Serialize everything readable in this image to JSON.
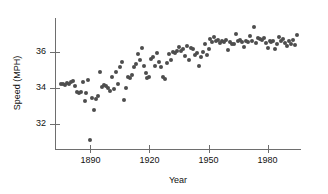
{
  "chart_data": {
    "type": "scatter",
    "title": "",
    "xlabel": "Year",
    "ylabel": "Speed (MPH)",
    "xlim": [
      1872,
      1997
    ],
    "ylim": [
      30.6,
      37.9
    ],
    "xticks": [
      1890,
      1920,
      1950,
      1980
    ],
    "xticklabels": [
      "1890",
      "1920",
      "1950",
      "1980"
    ],
    "yticks": [
      32,
      34,
      36
    ],
    "yticklabels": [
      "32",
      "34",
      "36"
    ],
    "grid": false,
    "legend": null,
    "marker_color": "#4d4d4d",
    "axis_color": "#6e6e6e",
    "points": [
      [
        1875,
        34.2
      ],
      [
        1876,
        34.25
      ],
      [
        1877,
        34.15
      ],
      [
        1878,
        34.3
      ],
      [
        1879,
        34.2
      ],
      [
        1880,
        34.35
      ],
      [
        1881,
        34.4
      ],
      [
        1882,
        34.1
      ],
      [
        1883,
        33.75
      ],
      [
        1884,
        33.7
      ],
      [
        1885,
        33.8
      ],
      [
        1886,
        34.35
      ],
      [
        1887,
        33.25
      ],
      [
        1888,
        33.7
      ],
      [
        1889,
        34.45
      ],
      [
        1890,
        31.1
      ],
      [
        1891,
        33.45
      ],
      [
        1892,
        32.75
      ],
      [
        1893,
        33.4
      ],
      [
        1894,
        33.55
      ],
      [
        1895,
        34.9
      ],
      [
        1896,
        34.05
      ],
      [
        1897,
        34.15
      ],
      [
        1898,
        34.1
      ],
      [
        1899,
        34.0
      ],
      [
        1900,
        33.85
      ],
      [
        1901,
        34.6
      ],
      [
        1902,
        33.95
      ],
      [
        1903,
        34.9
      ],
      [
        1904,
        34.2
      ],
      [
        1905,
        35.15
      ],
      [
        1906,
        35.45
      ],
      [
        1907,
        33.35
      ],
      [
        1908,
        34.0
      ],
      [
        1909,
        34.6
      ],
      [
        1910,
        34.55
      ],
      [
        1911,
        34.75
      ],
      [
        1912,
        35.15
      ],
      [
        1913,
        35.35
      ],
      [
        1914,
        35.9
      ],
      [
        1915,
        35.55
      ],
      [
        1916,
        36.25
      ],
      [
        1917,
        35.2
      ],
      [
        1918,
        34.85
      ],
      [
        1919,
        34.55
      ],
      [
        1920,
        34.6
      ],
      [
        1921,
        35.6
      ],
      [
        1922,
        35.7
      ],
      [
        1923,
        35.2
      ],
      [
        1924,
        35.95
      ],
      [
        1925,
        35.45
      ],
      [
        1926,
        35.15
      ],
      [
        1927,
        34.6
      ],
      [
        1928,
        34.5
      ],
      [
        1929,
        35.4
      ],
      [
        1930,
        35.9
      ],
      [
        1931,
        35.55
      ],
      [
        1932,
        36.0
      ],
      [
        1933,
        35.95
      ],
      [
        1934,
        36.05
      ],
      [
        1935,
        36.3
      ],
      [
        1936,
        36.05
      ],
      [
        1937,
        36.2
      ],
      [
        1938,
        35.8
      ],
      [
        1939,
        36.35
      ],
      [
        1940,
        35.55
      ],
      [
        1941,
        36.25
      ],
      [
        1942,
        36.2
      ],
      [
        1943,
        35.85
      ],
      [
        1944,
        35.95
      ],
      [
        1945,
        35.2
      ],
      [
        1946,
        35.75
      ],
      [
        1947,
        36.0
      ],
      [
        1948,
        36.45
      ],
      [
        1949,
        35.85
      ],
      [
        1950,
        36.2
      ],
      [
        1951,
        36.75
      ],
      [
        1952,
        36.55
      ],
      [
        1953,
        36.85
      ],
      [
        1954,
        36.6
      ],
      [
        1955,
        36.7
      ],
      [
        1956,
        36.5
      ],
      [
        1957,
        36.6
      ],
      [
        1958,
        36.55
      ],
      [
        1959,
        36.65
      ],
      [
        1960,
        36.1
      ],
      [
        1961,
        36.55
      ],
      [
        1962,
        36.45
      ],
      [
        1963,
        36.45
      ],
      [
        1964,
        37.0
      ],
      [
        1965,
        36.6
      ],
      [
        1966,
        36.7
      ],
      [
        1967,
        36.55
      ],
      [
        1968,
        36.3
      ],
      [
        1969,
        36.6
      ],
      [
        1970,
        36.55
      ],
      [
        1971,
        36.9
      ],
      [
        1972,
        36.6
      ],
      [
        1973,
        37.4
      ],
      [
        1974,
        36.5
      ],
      [
        1975,
        36.8
      ],
      [
        1976,
        36.75
      ],
      [
        1977,
        36.7
      ],
      [
        1978,
        36.8
      ],
      [
        1979,
        36.5
      ],
      [
        1980,
        36.25
      ],
      [
        1981,
        36.6
      ],
      [
        1982,
        36.55
      ],
      [
        1983,
        36.6
      ],
      [
        1984,
        36.2
      ],
      [
        1985,
        36.45
      ],
      [
        1986,
        36.85
      ],
      [
        1987,
        36.6
      ],
      [
        1988,
        36.75
      ],
      [
        1989,
        36.5
      ],
      [
        1990,
        36.35
      ],
      [
        1991,
        36.6
      ],
      [
        1992,
        36.45
      ],
      [
        1993,
        36.7
      ],
      [
        1994,
        36.4
      ],
      [
        1995,
        36.95
      ]
    ]
  }
}
